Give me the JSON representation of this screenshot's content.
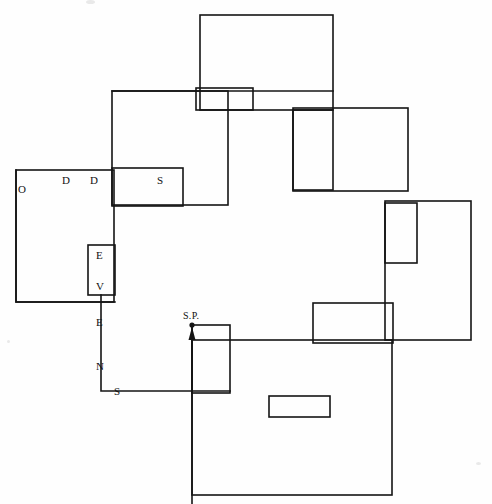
{
  "figure": {
    "background_color": "#fefefe",
    "stroke_color": "#151515",
    "stroke_width": 1.6,
    "width": 492,
    "height": 504
  },
  "labels": {
    "odds": [
      {
        "text": "O",
        "x": 18,
        "y": 184
      },
      {
        "text": "D",
        "x": 62,
        "y": 175
      },
      {
        "text": "D",
        "x": 90,
        "y": 175
      },
      {
        "text": "S",
        "x": 157,
        "y": 175
      }
    ],
    "evens": [
      {
        "text": "E",
        "x": 96,
        "y": 250
      },
      {
        "text": "V",
        "x": 96,
        "y": 281
      },
      {
        "text": "E",
        "x": 96,
        "y": 317
      },
      {
        "text": "N",
        "x": 96,
        "y": 361
      },
      {
        "text": "S",
        "x": 114,
        "y": 386
      }
    ],
    "start_point": {
      "text": "S.P.",
      "x": 183,
      "y": 311
    }
  },
  "shapes": {
    "rectangles": [
      {
        "name": "top-large-rect",
        "x": 200,
        "y": 15,
        "w": 133,
        "h": 95
      },
      {
        "name": "top-small-rect",
        "x": 196,
        "y": 88,
        "w": 57,
        "h": 22
      },
      {
        "name": "odds-upper-rect",
        "x": 112,
        "y": 91,
        "w": 116,
        "h": 114
      },
      {
        "name": "odds-s-rect",
        "x": 112,
        "y": 168,
        "w": 71,
        "h": 38
      },
      {
        "name": "left-large-rect",
        "x": 16,
        "y": 170,
        "w": 98,
        "h": 132
      },
      {
        "name": "evens-small-rect",
        "x": 88,
        "y": 245,
        "w": 27,
        "h": 50
      },
      {
        "name": "right-tall-narrow-rect",
        "x": 293,
        "y": 110,
        "w": 40,
        "h": 80
      },
      {
        "name": "right-wide-rect",
        "x": 293,
        "y": 108,
        "w": 115,
        "h": 83
      },
      {
        "name": "mid-right-narrow-rect",
        "x": 385,
        "y": 203,
        "w": 32,
        "h": 60
      },
      {
        "name": "mid-right-large-rect",
        "x": 385,
        "y": 201,
        "w": 86,
        "h": 139
      },
      {
        "name": "lower-mid-rect",
        "x": 313,
        "y": 303,
        "w": 80,
        "h": 40
      },
      {
        "name": "sp-rect",
        "x": 192,
        "y": 325,
        "w": 38,
        "h": 68
      },
      {
        "name": "bottom-small-rect",
        "x": 269,
        "y": 396,
        "w": 61,
        "h": 21
      },
      {
        "name": "bottom-large-rect",
        "x": 192,
        "y": 340,
        "w": 200,
        "h": 155
      }
    ],
    "connector_paths": [
      {
        "name": "top-link-path",
        "d": "M 112 91 L 333 91"
      },
      {
        "name": "odds-left-path",
        "d": "M 16 170 L 16 302 L 115 302"
      },
      {
        "name": "evens-down-path",
        "d": "M 101 295 L 101 391 L 230 391"
      },
      {
        "name": "sp-stem-path",
        "d": "M 192 340 L 192 504"
      }
    ],
    "arrow": {
      "name": "sp-arrow",
      "from_x": 192,
      "from_y": 393,
      "to_x": 192,
      "to_y": 325,
      "head_width": 7,
      "head_length": 13,
      "dot_radius": 2.6
    }
  }
}
